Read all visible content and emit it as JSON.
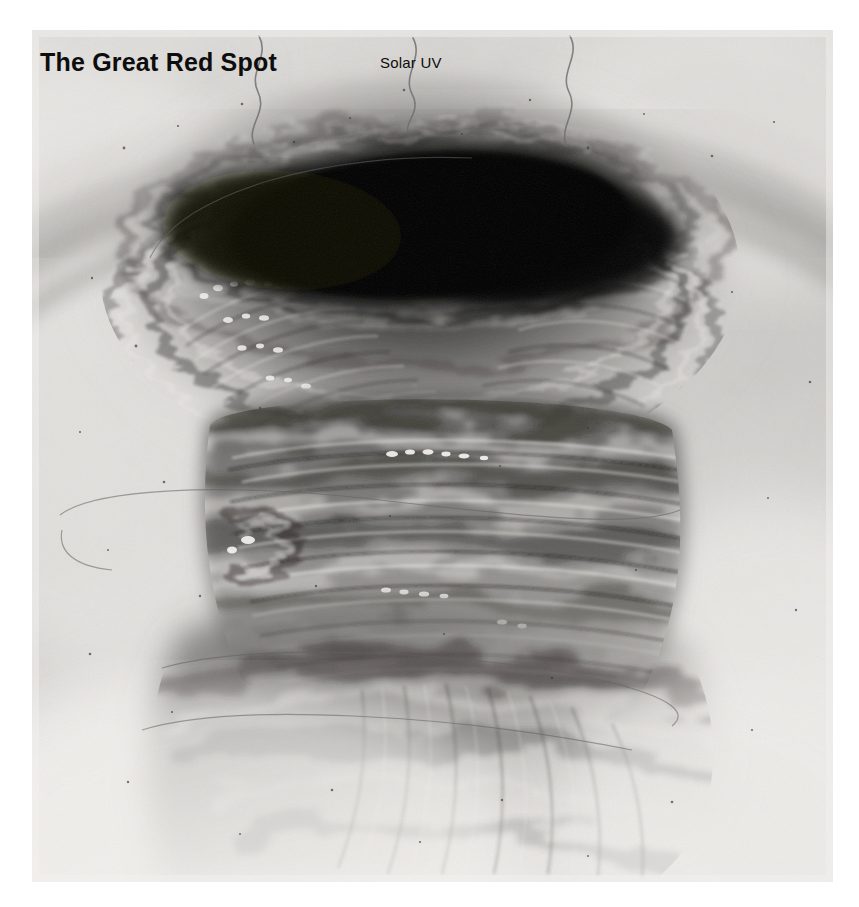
{
  "figure": {
    "kind": "grayscale-airbrush-illustration",
    "width_px": 859,
    "height_px": 907,
    "plate": {
      "left_px": 32,
      "top_px": 30,
      "width_px": 801,
      "height_px": 852,
      "background_hex": "#d8d8d6"
    }
  },
  "labels": {
    "title": "The Great Red Spot",
    "solar_uv": "Solar UV"
  },
  "colors": {
    "ink": "#0d0d0d",
    "paper": "#ffffff",
    "plate_base": "#d8d8d6",
    "plate_light": "#eceae7",
    "plate_mid": "#9a9895",
    "plate_dark": "#4a4947",
    "eye_core": "#050505",
    "ray_line": "#6b6a68"
  },
  "annotations": {
    "uv_rays": [
      {
        "name": "uv-ray-left",
        "x_top_px": 259,
        "y_top_px": 36,
        "y_bottom_px": 150
      },
      {
        "name": "uv-ray-center",
        "x_top_px": 413,
        "y_top_px": 38,
        "y_bottom_px": 130
      },
      {
        "name": "uv-ray-right",
        "x_top_px": 570,
        "y_top_px": 36,
        "y_bottom_px": 145
      }
    ],
    "contour_outlines": [
      "upper-vortex-rim-ellipse",
      "mid-column-ellipse",
      "lower-column-ellipse"
    ]
  },
  "structure": {
    "eye": {
      "name": "storm-eye-void",
      "center_x_px": 430,
      "center_y_px": 225,
      "rx_px": 215,
      "ry_px": 78,
      "rotation_deg": -5
    },
    "upper_vortex": {
      "name": "upper-vortex-bowl",
      "center_x_px": 420,
      "center_y_px": 270,
      "rx_px": 305,
      "ry_px": 185
    },
    "column": {
      "name": "vortex-column",
      "top_y_px": 430,
      "bottom_y_px": 700,
      "left_x_px": 205,
      "right_x_px": 660
    },
    "outflow": {
      "name": "lower-outflow-skirt",
      "top_y_px": 640,
      "bottom_y_px": 870
    }
  }
}
